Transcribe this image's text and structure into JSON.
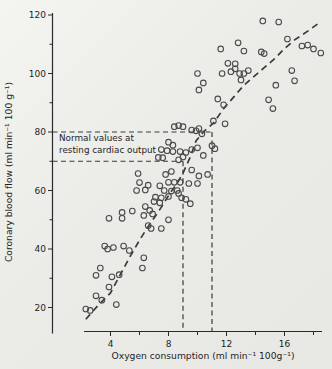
{
  "figure": {
    "kind": "scanned-scatter-figure",
    "background": "#ebebe8"
  },
  "chart_data": {
    "type": "scatter",
    "title": "",
    "xlabel": "Oxygen consumption (ml min⁻¹ 100g⁻¹)",
    "ylabel": "Coronary blood flow (ml min⁻¹ 100 g⁻¹)",
    "xlim": [
      0,
      18.6
    ],
    "ylim": [
      12,
      120.5
    ],
    "x_major_ticks": [
      4,
      8,
      12,
      16
    ],
    "x_minor_ticks": [
      6,
      10,
      14,
      18
    ],
    "y_major_ticks": [
      20,
      40,
      60,
      80,
      100,
      120
    ],
    "y_minor_ticks": [
      30,
      50,
      70,
      90,
      110
    ],
    "grid": false,
    "legend": null,
    "marker": "open-circle",
    "colors": {
      "marker": "#4a4a4a",
      "curve": "#3a3a3a",
      "reference": "#3a3a3a",
      "axis": "#2a2a2a",
      "text": "#1e1e1e"
    },
    "points": [
      [
        2.3,
        19.5
      ],
      [
        2.6,
        19.0
      ],
      [
        3.0,
        24.0
      ],
      [
        3.4,
        22.5
      ],
      [
        4.4,
        21.0
      ],
      [
        3.9,
        27.0
      ],
      [
        3.0,
        31.0
      ],
      [
        4.1,
        30.5
      ],
      [
        4.6,
        31.2
      ],
      [
        3.3,
        33.5
      ],
      [
        6.2,
        33.5
      ],
      [
        3.6,
        41.0
      ],
      [
        3.8,
        40.0
      ],
      [
        4.2,
        40.5
      ],
      [
        5.3,
        39.5
      ],
      [
        6.3,
        37.0
      ],
      [
        4.9,
        41.0
      ],
      [
        6.8,
        47.0
      ],
      [
        7.5,
        47.0
      ],
      [
        6.6,
        48.0
      ],
      [
        8.0,
        50.0
      ],
      [
        3.9,
        50.5
      ],
      [
        4.8,
        50.5
      ],
      [
        6.3,
        51.5
      ],
      [
        6.9,
        52.0
      ],
      [
        4.8,
        52.5
      ],
      [
        5.5,
        53.0
      ],
      [
        6.7,
        53.2
      ],
      [
        6.4,
        54.5
      ],
      [
        7.0,
        56.2
      ],
      [
        7.4,
        55.8
      ],
      [
        7.1,
        57.7
      ],
      [
        7.5,
        57.5
      ],
      [
        8.0,
        58.0
      ],
      [
        5.8,
        60.0
      ],
      [
        6.4,
        60.2
      ],
      [
        7.7,
        60.0
      ],
      [
        8.2,
        59.8
      ],
      [
        8.6,
        60.0
      ],
      [
        8.7,
        59.0
      ],
      [
        8.9,
        57.5
      ],
      [
        9.2,
        57.0
      ],
      [
        9.5,
        55.5
      ],
      [
        7.4,
        61.6
      ],
      [
        6.0,
        62.7
      ],
      [
        6.6,
        61.8
      ],
      [
        8.0,
        62.8
      ],
      [
        8.4,
        62.8
      ],
      [
        8.8,
        62.8
      ],
      [
        9.4,
        62.4
      ],
      [
        10.0,
        62.4
      ],
      [
        5.9,
        65.8
      ],
      [
        7.8,
        65.5
      ],
      [
        8.2,
        66.5
      ],
      [
        9.6,
        67.0
      ],
      [
        10.1,
        65.0
      ],
      [
        10.7,
        65.5
      ],
      [
        7.3,
        71.3
      ],
      [
        7.6,
        71.2
      ],
      [
        8.7,
        70.5
      ],
      [
        9.0,
        71.5
      ],
      [
        10.4,
        72.0
      ],
      [
        7.5,
        74.0
      ],
      [
        7.9,
        73.6
      ],
      [
        8.3,
        73.3
      ],
      [
        8.8,
        73.3
      ],
      [
        9.2,
        73.0
      ],
      [
        9.6,
        74.0
      ],
      [
        10.0,
        74.6
      ],
      [
        11.0,
        75.3
      ],
      [
        11.2,
        74.3
      ],
      [
        8.0,
        76.5
      ],
      [
        8.3,
        75.5
      ],
      [
        8.4,
        81.8
      ],
      [
        8.7,
        82.2
      ],
      [
        9.0,
        81.8
      ],
      [
        9.6,
        80.7
      ],
      [
        9.9,
        80.4
      ],
      [
        10.1,
        81.2
      ],
      [
        10.3,
        79.4
      ],
      [
        11.1,
        83.8
      ],
      [
        11.9,
        82.8
      ],
      [
        11.4,
        91.3
      ],
      [
        11.8,
        89.3
      ],
      [
        10.1,
        94.4
      ],
      [
        10.4,
        96.8
      ],
      [
        14.9,
        91.0
      ],
      [
        15.2,
        88.0
      ],
      [
        15.4,
        96.0
      ],
      [
        16.7,
        97.5
      ],
      [
        10.0,
        100.0
      ],
      [
        11.7,
        100.0
      ],
      [
        12.1,
        103.5
      ],
      [
        12.6,
        103.3
      ],
      [
        12.3,
        100.6
      ],
      [
        12.6,
        101.6
      ],
      [
        12.9,
        100.0
      ],
      [
        13.2,
        100.0
      ],
      [
        13.5,
        101.0
      ],
      [
        13.0,
        97.8
      ],
      [
        16.5,
        101.0
      ],
      [
        11.6,
        108.4
      ],
      [
        12.8,
        110.5
      ],
      [
        13.2,
        107.7
      ],
      [
        14.4,
        107.4
      ],
      [
        14.6,
        106.8
      ],
      [
        16.2,
        111.8
      ],
      [
        17.2,
        109.4
      ],
      [
        17.6,
        109.7
      ],
      [
        18.0,
        108.4
      ],
      [
        18.5,
        107.0
      ],
      [
        14.5,
        118.0
      ],
      [
        15.6,
        117.6
      ]
    ],
    "trend_curve": {
      "style": "dashed",
      "points": [
        [
          2.3,
          16
        ],
        [
          3.1,
          20.5
        ],
        [
          4.0,
          25
        ],
        [
          4.7,
          31.5
        ],
        [
          5.3,
          37
        ],
        [
          6.0,
          43
        ],
        [
          6.7,
          48.5
        ],
        [
          7.2,
          52
        ],
        [
          7.6,
          55
        ],
        [
          8.1,
          59
        ],
        [
          8.6,
          62.5
        ],
        [
          9.0,
          66
        ],
        [
          9.5,
          71.5
        ],
        [
          9.9,
          77
        ],
        [
          10.5,
          80.5
        ],
        [
          11.1,
          83
        ],
        [
          11.8,
          88
        ],
        [
          12.5,
          92
        ],
        [
          13.2,
          96
        ],
        [
          13.9,
          99
        ],
        [
          14.6,
          102
        ],
        [
          15.3,
          105
        ],
        [
          16.0,
          108.5
        ],
        [
          16.7,
          111.5
        ],
        [
          17.6,
          114.5
        ],
        [
          18.3,
          117
        ]
      ]
    },
    "reference_lines": {
      "style": "dashed",
      "annotation_line1": "Normal values at",
      "annotation_line2": "resting cardiac output",
      "flow_values": [
        70,
        80
      ],
      "oxygen_values": [
        9,
        11
      ]
    }
  }
}
